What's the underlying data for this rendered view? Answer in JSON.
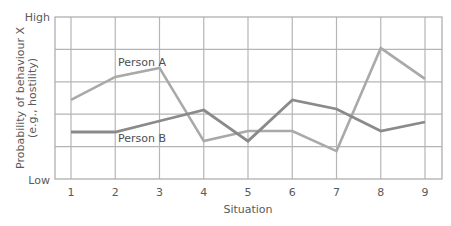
{
  "chart_data": {
    "type": "line",
    "title": "",
    "xlabel": "Situation",
    "ylabel_line1": "Probability of behaviour X",
    "ylabel_line2": "(e.g., hostility)",
    "y_high_label": "High",
    "y_low_label": "Low",
    "categories": [
      "1",
      "2",
      "3",
      "4",
      "5",
      "6",
      "7",
      "8",
      "9"
    ],
    "ylim": [
      0,
      5
    ],
    "grid": true,
    "legend": "inline labels",
    "series": [
      {
        "name": "Person A",
        "color": "#a9a9a9",
        "values": [
          2.44,
          3.15,
          3.43,
          1.17,
          1.48,
          1.48,
          0.86,
          4.04,
          3.09
        ]
      },
      {
        "name": "Person B",
        "color": "#8a8a8a",
        "values": [
          1.45,
          1.45,
          1.79,
          2.13,
          1.17,
          2.44,
          2.16,
          1.48,
          1.76
        ]
      }
    ]
  }
}
